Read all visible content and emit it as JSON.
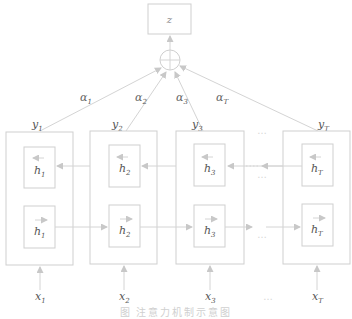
{
  "output": {
    "label": "z"
  },
  "combine": {
    "symbol": "⊕"
  },
  "attention_weights": [
    {
      "greek": "α",
      "sub": "1"
    },
    {
      "greek": "α",
      "sub": "2"
    },
    {
      "greek": "α",
      "sub": "3"
    },
    {
      "greek": "α",
      "sub": "T"
    }
  ],
  "cells": [
    {
      "y": "y",
      "y_sub": "1",
      "h_back": "h",
      "h_back_sub": "1",
      "h_fwd": "h",
      "h_fwd_sub": "1",
      "x": "x",
      "x_sub": "1"
    },
    {
      "y": "y",
      "y_sub": "2",
      "h_back": "h",
      "h_back_sub": "2",
      "h_fwd": "h",
      "h_fwd_sub": "2",
      "x": "x",
      "x_sub": "2"
    },
    {
      "y": "y",
      "y_sub": "3",
      "h_back": "h",
      "h_back_sub": "3",
      "h_fwd": "h",
      "h_fwd_sub": "3",
      "x": "x",
      "x_sub": "3"
    },
    {
      "y": "y",
      "y_sub": "T",
      "h_back": "h",
      "h_back_sub": "T",
      "h_fwd": "h",
      "h_fwd_sub": "T",
      "x": "x",
      "x_sub": "T"
    }
  ],
  "ellipsis": "…",
  "caption": "图      注意力机制示意图",
  "colors": {
    "stroke": "#cfcfcf",
    "text": "#555555",
    "caption": "#d0d0d0"
  }
}
